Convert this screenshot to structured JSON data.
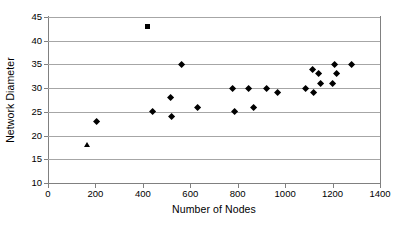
{
  "chart_data": {
    "type": "scatter",
    "title": "",
    "xlabel": "Number of Nodes",
    "ylabel": "Network Diameter",
    "xlim": [
      0,
      1400
    ],
    "ylim": [
      10,
      45
    ],
    "xticks": [
      0,
      200,
      400,
      600,
      800,
      1000,
      1200,
      1400
    ],
    "yticks": [
      10,
      15,
      20,
      25,
      30,
      35,
      40,
      45
    ],
    "xtick_labels": [
      "0",
      "200",
      "400",
      "600",
      "800",
      "1000",
      "1200",
      "1400"
    ],
    "ytick_labels": [
      "10",
      "15",
      "20",
      "25",
      "30",
      "35",
      "40",
      "45"
    ],
    "grid": "horizontal",
    "legend": "none",
    "marker_color": "#000000",
    "gridline_color": "#a6a6a6",
    "axis_color": "#808080",
    "series": [
      {
        "name": "diamond-series",
        "marker": "diamond",
        "points": [
          [
            205,
            23
          ],
          [
            440,
            25
          ],
          [
            515,
            28
          ],
          [
            520,
            24
          ],
          [
            565,
            35
          ],
          [
            630,
            26
          ],
          [
            780,
            30
          ],
          [
            785,
            25
          ],
          [
            845,
            30
          ],
          [
            865,
            26
          ],
          [
            920,
            30
          ],
          [
            970,
            29
          ],
          [
            1085,
            30
          ],
          [
            1115,
            34
          ],
          [
            1120,
            29
          ],
          [
            1140,
            33
          ],
          [
            1150,
            31
          ],
          [
            1200,
            31
          ],
          [
            1210,
            35
          ],
          [
            1215,
            33
          ],
          [
            1280,
            35
          ]
        ]
      },
      {
        "name": "square-series",
        "marker": "square",
        "points": [
          [
            420,
            43
          ]
        ]
      },
      {
        "name": "triangle-series",
        "marker": "triangle",
        "points": [
          [
            165,
            18
          ]
        ]
      }
    ]
  }
}
